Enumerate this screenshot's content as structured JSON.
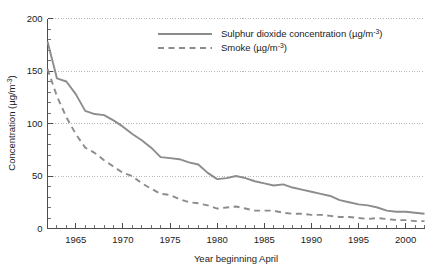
{
  "chart_data": {
    "type": "line",
    "title": "",
    "xlabel": "Year beginning April",
    "ylabel": "Concentration (µg/m⁻³)",
    "ylabel_base": "Concentration (µg/m",
    "ylabel_sup": "-3",
    "ylabel_tail": ")",
    "xlim": [
      1962,
      2002
    ],
    "ylim": [
      0,
      200
    ],
    "grid": "horizontal-dotted",
    "legend_position": "top-center",
    "x": [
      1962,
      1963,
      1964,
      1965,
      1966,
      1967,
      1968,
      1969,
      1970,
      1971,
      1972,
      1973,
      1974,
      1975,
      1976,
      1977,
      1978,
      1979,
      1980,
      1981,
      1982,
      1983,
      1984,
      1985,
      1986,
      1987,
      1988,
      1989,
      1990,
      1991,
      1992,
      1993,
      1994,
      1995,
      1996,
      1997,
      1998,
      1999,
      2000,
      2001,
      2002
    ],
    "xticks": [
      1965,
      1970,
      1975,
      1980,
      1985,
      1990,
      1995,
      2000
    ],
    "xticklabels": [
      "1965",
      "1970",
      "1975",
      "1980",
      "1985",
      "1990",
      "1995",
      "2000"
    ],
    "yticks": [
      0,
      50,
      100,
      150,
      200
    ],
    "yticklabels": [
      "0",
      "50",
      "100",
      "150",
      "200"
    ],
    "ytick_minor_step": 10,
    "xtick_minor_step": 1,
    "series": [
      {
        "name": "Sulphur dioxide concentration (µg/m⁻³)",
        "label_base": "Sulphur dioxide concentration (µg/m",
        "label_sup": "-3",
        "label_tail": ")",
        "style": "solid",
        "color": "#8c8c8c",
        "values": [
          178,
          143,
          140,
          128,
          112,
          109,
          108,
          103,
          97,
          90,
          84,
          77,
          68,
          67,
          66,
          63,
          61,
          53,
          47,
          48,
          50,
          48,
          45,
          43,
          41,
          42,
          39,
          37,
          35,
          33,
          31,
          27,
          25,
          23,
          22,
          20,
          17,
          16,
          16,
          15,
          14
        ]
      },
      {
        "name": "Smoke (µg/m⁻³)",
        "label_base": "Smoke (µg/m",
        "label_sup": "-3",
        "label_tail": ")",
        "style": "dashed",
        "color": "#8c8c8c",
        "values": [
          152,
          126,
          106,
          90,
          77,
          72,
          65,
          59,
          53,
          50,
          43,
          38,
          33,
          32,
          28,
          25,
          24,
          22,
          19,
          20,
          21,
          19,
          17,
          17,
          17,
          15,
          14,
          14,
          13,
          13,
          12,
          11,
          11,
          10,
          9,
          10,
          9,
          8,
          8,
          7,
          7
        ]
      }
    ]
  },
  "legend": {
    "entries": [
      {
        "key": "sulphur-dioxide",
        "series_index": 0
      },
      {
        "key": "smoke",
        "series_index": 1
      }
    ]
  }
}
